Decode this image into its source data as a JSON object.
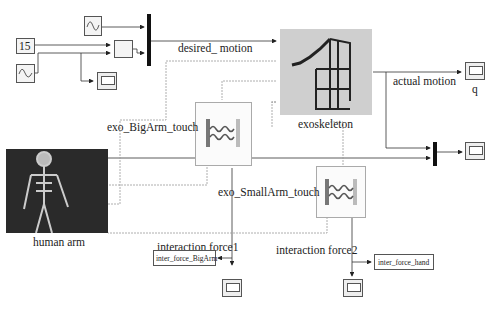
{
  "blocks": {
    "constant": {
      "value": "15"
    },
    "exoskeleton": {
      "label": "exoskeleton"
    },
    "human_arm": {
      "label": "human arm"
    },
    "scope_q": {
      "label": "q"
    },
    "goto_bigarm": {
      "label": "inter_force_BigArm"
    },
    "goto_hand": {
      "label": "inter_force_hand"
    },
    "spring_bigarm": {
      "label": "exo_BigArm_touch"
    },
    "spring_smallarm": {
      "label": "exo_SmallArm_touch"
    }
  },
  "signals": {
    "desired_motion": "desired_ motion",
    "actual_motion": "actual motion",
    "interaction_force1": "interaction force1",
    "interaction_force2": "interaction force2"
  },
  "colors": {
    "wire": "#333333",
    "dashed_wire": "#9a9a9a",
    "mux": "#111111",
    "block_border": "#555555"
  }
}
